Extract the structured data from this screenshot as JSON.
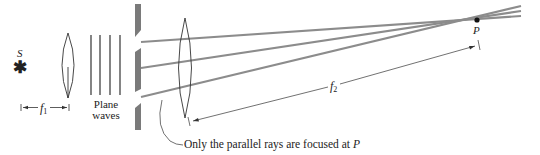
{
  "diagram": {
    "source_label": "S",
    "source_symbol": "✱",
    "f1_label": "f",
    "f1_sub": "1",
    "f2_label": "f",
    "f2_sub": "2",
    "plane_waves_line1": "Plane",
    "plane_waves_line2": "waves",
    "point_label": "P",
    "caption_text": "Only the parallel rays are focused at ",
    "caption_point": "P",
    "colors": {
      "ray": "#8c8c8c",
      "barrier": "#7a7a7a",
      "line": "#333333",
      "dot": "#111111"
    }
  }
}
